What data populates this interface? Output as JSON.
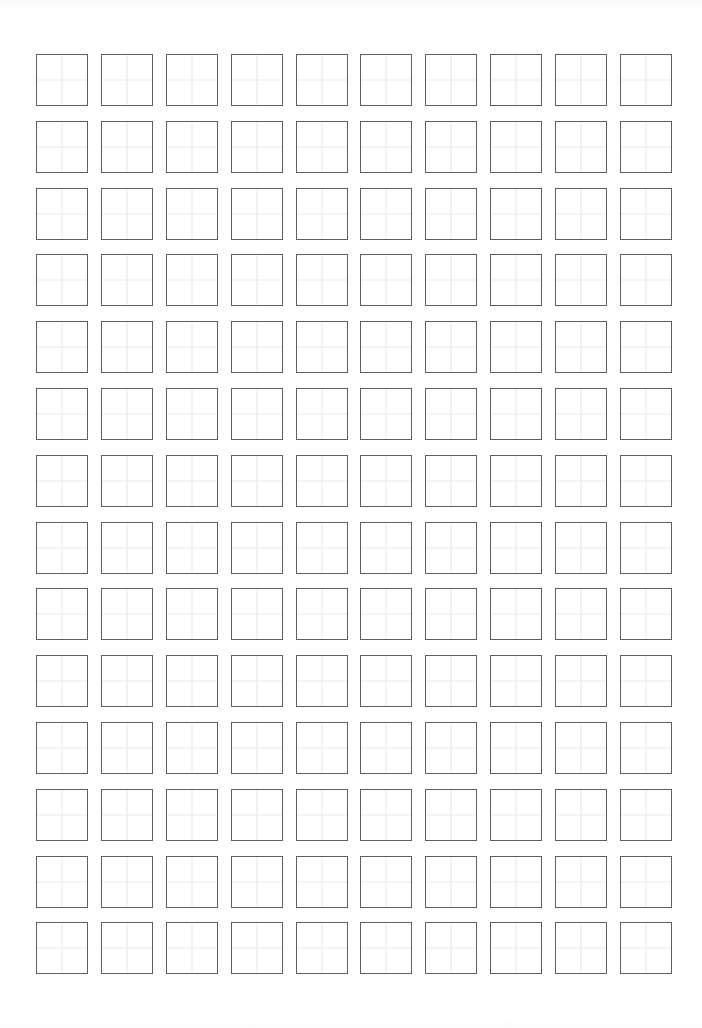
{
  "document": {
    "title": "Chinese character practice sheet",
    "sheet_type": "tianzige-grid-paper",
    "page_width_px": 702,
    "page_height_px": 1028,
    "background_color": "#ffffff"
  },
  "grid": {
    "columns": 10,
    "rows": 14,
    "total_cells": 140,
    "cell_size_px": 52,
    "column_gap_px": 13,
    "row_gap_px": 15,
    "origin_x_px": 36,
    "origin_y_px": 54,
    "cell_border_color": "#5e5e62",
    "cell_border_width_px": 1,
    "guide_line_color": "#e6e6e8",
    "guide_lines": [
      "vertical-center",
      "horizontal-center"
    ],
    "cell_fill_color": "#ffffff"
  },
  "cells": [
    [
      "",
      "",
      "",
      "",
      "",
      "",
      "",
      "",
      "",
      ""
    ],
    [
      "",
      "",
      "",
      "",
      "",
      "",
      "",
      "",
      "",
      ""
    ],
    [
      "",
      "",
      "",
      "",
      "",
      "",
      "",
      "",
      "",
      ""
    ],
    [
      "",
      "",
      "",
      "",
      "",
      "",
      "",
      "",
      "",
      ""
    ],
    [
      "",
      "",
      "",
      "",
      "",
      "",
      "",
      "",
      "",
      ""
    ],
    [
      "",
      "",
      "",
      "",
      "",
      "",
      "",
      "",
      "",
      ""
    ],
    [
      "",
      "",
      "",
      "",
      "",
      "",
      "",
      "",
      "",
      ""
    ],
    [
      "",
      "",
      "",
      "",
      "",
      "",
      "",
      "",
      "",
      ""
    ],
    [
      "",
      "",
      "",
      "",
      "",
      "",
      "",
      "",
      "",
      ""
    ],
    [
      "",
      "",
      "",
      "",
      "",
      "",
      "",
      "",
      "",
      ""
    ],
    [
      "",
      "",
      "",
      "",
      "",
      "",
      "",
      "",
      "",
      ""
    ],
    [
      "",
      "",
      "",
      "",
      "",
      "",
      "",
      "",
      "",
      ""
    ],
    [
      "",
      "",
      "",
      "",
      "",
      "",
      "",
      "",
      "",
      ""
    ],
    [
      "",
      "",
      "",
      "",
      "",
      "",
      "",
      "",
      "",
      ""
    ]
  ]
}
